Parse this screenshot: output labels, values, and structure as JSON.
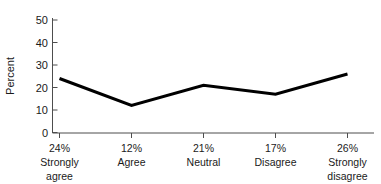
{
  "chart_data": {
    "type": "line",
    "title": "",
    "xlabel": "",
    "ylabel": "Percent",
    "categories": [
      "Strongly agree",
      "Agree",
      "Neutral",
      "Disagree",
      "Strongly disagree"
    ],
    "percent_labels": [
      "24%",
      "12%",
      "21%",
      "17%",
      "26%"
    ],
    "values": [
      24,
      12,
      21,
      17,
      26
    ],
    "ylim": [
      0,
      50
    ],
    "yticks": [
      0,
      10,
      20,
      30,
      40,
      50
    ],
    "ytick_labels": [
      "0",
      "10",
      "20",
      "30",
      "40",
      "50"
    ],
    "grid": false,
    "legend": null,
    "series": [
      {
        "name": "Percent",
        "values": [
          24,
          12,
          21,
          17,
          26
        ],
        "color": "#000000"
      }
    ]
  },
  "axis": {
    "y_title": "Percent",
    "line_color": "#000000",
    "axis_color": "#4d4d4d"
  },
  "xlabels": [
    {
      "percent": "24%",
      "line1": "Strongly",
      "line2": "agree"
    },
    {
      "percent": "12%",
      "line1": "Agree",
      "line2": ""
    },
    {
      "percent": "21%",
      "line1": "Neutral",
      "line2": ""
    },
    {
      "percent": "17%",
      "line1": "Disagree",
      "line2": ""
    },
    {
      "percent": "26%",
      "line1": "Strongly",
      "line2": "disagree"
    }
  ],
  "yticks": [
    {
      "label": "50"
    },
    {
      "label": "40"
    },
    {
      "label": "30"
    },
    {
      "label": "20"
    },
    {
      "label": "10"
    },
    {
      "label": "0"
    }
  ]
}
